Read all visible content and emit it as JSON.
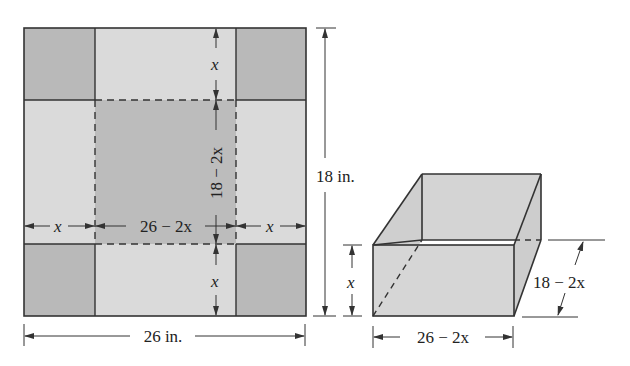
{
  "diagram": {
    "colors": {
      "corner": "#b9b9b9",
      "flap": "#d9d9d9",
      "base": "#bdbdbd",
      "box_face": "#d4d4d4",
      "line": "#333333"
    },
    "sheet": {
      "width_label": "26 in.",
      "height_label": "18 in.",
      "top_cut_label": "x",
      "bottom_cut_label": "x",
      "left_cut_label": "x",
      "right_cut_label": "x",
      "base_width_label": "26 − 2x",
      "base_height_label": "18 − 2x"
    },
    "box": {
      "height_label": "x",
      "length_label": "26 − 2x",
      "depth_label": "18 − 2x"
    }
  }
}
